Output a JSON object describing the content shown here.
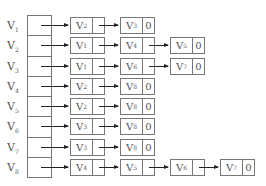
{
  "diagram": {
    "type": "adjacency-list",
    "null_marker": "0",
    "vertices": [
      {
        "name": "V",
        "sub": "1",
        "adjacent": [
          {
            "name": "V",
            "sub": "2"
          },
          {
            "name": "V",
            "sub": "3"
          }
        ]
      },
      {
        "name": "V",
        "sub": "2",
        "adjacent": [
          {
            "name": "V",
            "sub": "1"
          },
          {
            "name": "V",
            "sub": "4"
          },
          {
            "name": "V",
            "sub": "5"
          }
        ]
      },
      {
        "name": "V",
        "sub": "3",
        "adjacent": [
          {
            "name": "V",
            "sub": "1"
          },
          {
            "name": "V",
            "sub": "6"
          },
          {
            "name": "V",
            "sub": "7"
          }
        ]
      },
      {
        "name": "V",
        "sub": "4",
        "adjacent": [
          {
            "name": "V",
            "sub": "2"
          },
          {
            "name": "V",
            "sub": "8"
          }
        ]
      },
      {
        "name": "V",
        "sub": "5",
        "adjacent": [
          {
            "name": "V",
            "sub": "2"
          },
          {
            "name": "V",
            "sub": "8"
          }
        ]
      },
      {
        "name": "V",
        "sub": "6",
        "adjacent": [
          {
            "name": "V",
            "sub": "3"
          },
          {
            "name": "V",
            "sub": "8"
          }
        ]
      },
      {
        "name": "V",
        "sub": "7",
        "adjacent": [
          {
            "name": "V",
            "sub": "3"
          },
          {
            "name": "V",
            "sub": "8"
          }
        ]
      },
      {
        "name": "V",
        "sub": "8",
        "adjacent": [
          {
            "name": "V",
            "sub": "4"
          },
          {
            "name": "V",
            "sub": "5"
          },
          {
            "name": "V",
            "sub": "6"
          },
          {
            "name": "V",
            "sub": "7"
          }
        ]
      }
    ]
  }
}
